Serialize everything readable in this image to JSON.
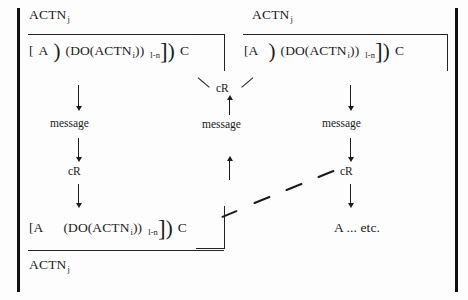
{
  "figure": {
    "ink_color": "#1b1b1b",
    "background": "#ffffff"
  },
  "columns": {
    "left": {
      "header": "ACTN",
      "header_sub": "j",
      "formula": {
        "open_bracket": "[",
        "a": "A",
        "paren1": ")",
        "do_open": "(DO(ACTN",
        "do_sub": "i",
        "do_close": "))",
        "range_sub": "l-n",
        "close_bracket": "]",
        "paren2": ")",
        "c": "C"
      },
      "steps": [
        {
          "kind": "arrow",
          "direction": "down"
        },
        {
          "kind": "label",
          "text": "message"
        },
        {
          "kind": "arrow",
          "direction": "down"
        },
        {
          "kind": "label",
          "text": "cR"
        },
        {
          "kind": "arrow",
          "direction": "down"
        }
      ],
      "result": {
        "open_bracket": "[A",
        "do_open": "(DO(ACTN",
        "do_sub": "i",
        "do_close": "))",
        "range_sub": "l-n",
        "close_bracket": "]",
        "paren2": ")",
        "c": "C"
      },
      "footer": "ACTN",
      "footer_sub": "j"
    },
    "middle": {
      "label_cR": "cR",
      "label_message": "message",
      "steps": [
        {
          "kind": "arrow",
          "direction": "up"
        },
        {
          "kind": "arrow",
          "direction": "up"
        }
      ]
    },
    "right": {
      "header": "ACTN",
      "header_sub": "j",
      "formula": {
        "open_bracket": "[A",
        "paren1": ")",
        "do_open": "(DO(ACTN",
        "do_sub": "i",
        "do_close": "))",
        "range_sub": "l-n",
        "close_bracket": "]",
        "paren2": ")",
        "c": "C"
      },
      "steps": [
        {
          "kind": "arrow",
          "direction": "down"
        },
        {
          "kind": "label",
          "text": "message"
        },
        {
          "kind": "arrow",
          "direction": "down"
        },
        {
          "kind": "label",
          "text": "cR"
        },
        {
          "kind": "arrow",
          "direction": "down"
        }
      ],
      "terminal": "A ... etc."
    }
  }
}
